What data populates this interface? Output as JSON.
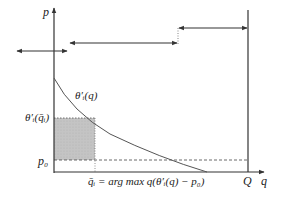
{
  "diagram": {
    "type": "economics-price-quantity",
    "axes": {
      "y_label": "p",
      "x_label": "q",
      "capacity_label": "Q"
    },
    "curve": {
      "label": "θ′ᵢ(q)",
      "description": "downward-sloping marginal valuation curve"
    },
    "levels": {
      "price_level_label": "θ′ᵢ(q̄ᵢ)",
      "reserve_price_label": "p₀"
    },
    "annotation": {
      "optimal_quantity": "q̄ᵢ = arg max q(θ′ᵢ(q) − p₀)"
    },
    "arrows": [
      {
        "name": "left-interval",
        "direction": "both"
      },
      {
        "name": "middle-interval",
        "direction": "both"
      },
      {
        "name": "right-interval",
        "direction": "both"
      }
    ],
    "colors": {
      "line": "#333333",
      "shade": "#c8c8c8",
      "curve": "#555555"
    }
  }
}
